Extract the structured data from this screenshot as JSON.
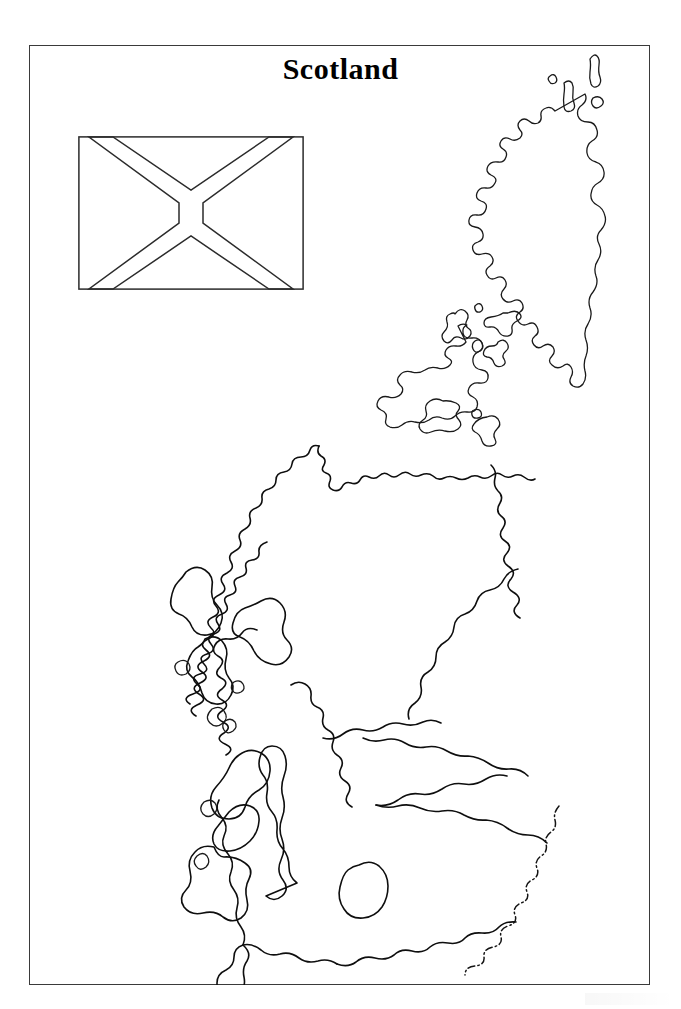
{
  "document": {
    "kind": "printable-outline-map-worksheet",
    "title": "Scotland",
    "background_color": "#ffffff",
    "ink_color": "#0e0e0e",
    "frame_color": "#3a3a3a"
  },
  "frame": {
    "label": "page-border",
    "x": 29,
    "y": 45,
    "width": 621,
    "height": 940
  },
  "flag": {
    "name": "Flag of Scotland",
    "common_name": "Saltire",
    "alt_name": "St Andrew's Cross",
    "style": "outline (uncoloured, for colouring in)",
    "x": 78,
    "y": 136,
    "width": 226,
    "height": 154,
    "outline_color": "#2b2b2b",
    "fill": "none",
    "official_colors": {
      "field": "#005EB8",
      "saltire": "#FFFFFF"
    }
  },
  "map": {
    "region": "Scotland",
    "projection_note": "stylised coastline outline, blank (no labels)",
    "features": [
      {
        "name": "Shetland Islands",
        "type": "island-group",
        "position": "top-right inset"
      },
      {
        "name": "Orkney Islands",
        "type": "island-group",
        "position": "north of mainland"
      },
      {
        "name": "Outer Hebrides",
        "type": "island-group",
        "position": "north-west"
      },
      {
        "name": "Isle of Skye",
        "type": "island",
        "position": "west"
      },
      {
        "name": "Isle of Mull",
        "type": "island",
        "position": "west"
      },
      {
        "name": "Islay",
        "type": "island",
        "position": "south-west"
      },
      {
        "name": "Jura",
        "type": "island",
        "position": "south-west"
      },
      {
        "name": "Arran",
        "type": "island",
        "position": "south-west"
      },
      {
        "name": "Kintyre",
        "type": "peninsula",
        "position": "south-west"
      },
      {
        "name": "Scotland-England border",
        "type": "political-border",
        "line_style": "dash-dot"
      }
    ],
    "line_styles": {
      "coastline": "solid",
      "political_border": "dash-dot"
    }
  },
  "footer": {
    "artifact": ""
  }
}
